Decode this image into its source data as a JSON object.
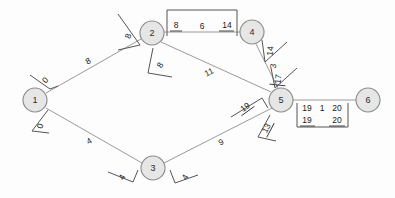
{
  "diagram": {
    "type": "node-link-graph",
    "background_color": "#fdfdfd",
    "node_fill": "#e6e6e6",
    "node_stroke": "#8a8a8a",
    "edge_stroke": "#9a9a9a",
    "nodes": [
      {
        "id": "1",
        "label": "1",
        "x": 35,
        "y": 100,
        "r": 12
      },
      {
        "id": "2",
        "label": "2",
        "x": 152,
        "y": 33,
        "r": 12
      },
      {
        "id": "3",
        "label": "3",
        "x": 153,
        "y": 168,
        "r": 12
      },
      {
        "id": "4",
        "label": "4",
        "x": 252,
        "y": 32,
        "r": 12
      },
      {
        "id": "5",
        "label": "5",
        "x": 281,
        "y": 100,
        "r": 12
      },
      {
        "id": "6",
        "label": "6",
        "x": 368,
        "y": 100,
        "r": 12
      }
    ],
    "edges": [
      {
        "from": "1",
        "to": "2",
        "weight": "8",
        "label_x": 88,
        "label_y": 61
      },
      {
        "from": "1",
        "to": "3",
        "weight": "4",
        "label_x": 89,
        "label_y": 141
      },
      {
        "from": "2",
        "to": "4",
        "weight": "6",
        "label_x": 202,
        "label_y": 26
      },
      {
        "from": "2",
        "to": "5",
        "weight": "11",
        "label_x": 209,
        "label_y": 72
      },
      {
        "from": "3",
        "to": "5",
        "weight": "9",
        "label_x": 221,
        "label_y": 142
      },
      {
        "from": "4",
        "to": "5",
        "weight": "3",
        "label_x": 273,
        "label_y": 66
      },
      {
        "from": "5",
        "to": "6",
        "weight": "1",
        "label_x": 322,
        "label_y": 108
      }
    ],
    "node_annotations": [
      {
        "node": "1",
        "value": "0",
        "x": 45,
        "y": 80,
        "rotation": -52
      },
      {
        "node": "1",
        "value": "0",
        "x": 40,
        "y": 126,
        "rotation": -70
      },
      {
        "node": "2",
        "value": "8",
        "x": 128,
        "y": 36,
        "rotation": -70
      },
      {
        "node": "2",
        "value": "8",
        "x": 160,
        "y": 65,
        "rotation": -62
      },
      {
        "node": "3",
        "value": "4",
        "x": 122,
        "y": 177,
        "rotation": -62
      },
      {
        "node": "3",
        "value": "4",
        "x": 185,
        "y": 177,
        "rotation": -62
      },
      {
        "node": "4",
        "value": "14",
        "x": 270,
        "y": 51,
        "rotation": -84
      },
      {
        "node": "4",
        "value": "17",
        "x": 278,
        "y": 79,
        "rotation": -84
      },
      {
        "node": "5",
        "value": "19",
        "x": 245,
        "y": 107,
        "rotation": -36
      },
      {
        "node": "5",
        "value": "13",
        "x": 266,
        "y": 128,
        "rotation": -62
      }
    ],
    "bracket_labels": [
      {
        "edge": "2-4",
        "left_value": "8",
        "mid_value": "6",
        "right_value": "14"
      },
      {
        "edge": "5-6",
        "top_left": "19",
        "top_mid": "1",
        "top_right": "20",
        "bottom_left": "19",
        "bottom_right": "20"
      }
    ]
  }
}
